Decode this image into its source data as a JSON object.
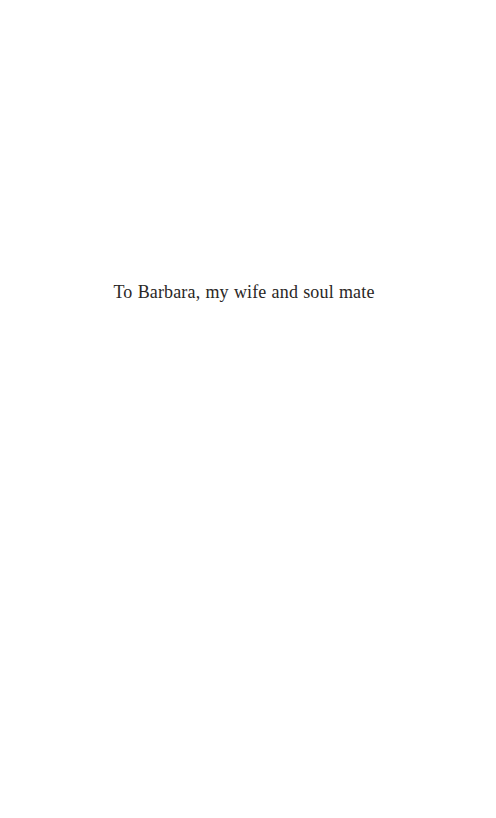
{
  "page": {
    "background_color": "#ffffff",
    "width": 496,
    "height": 818,
    "type": "book-dedication-page"
  },
  "dedication": {
    "text": "To Barbara, my wife and soul mate",
    "color": "#2a2725",
    "alignment": "center"
  }
}
